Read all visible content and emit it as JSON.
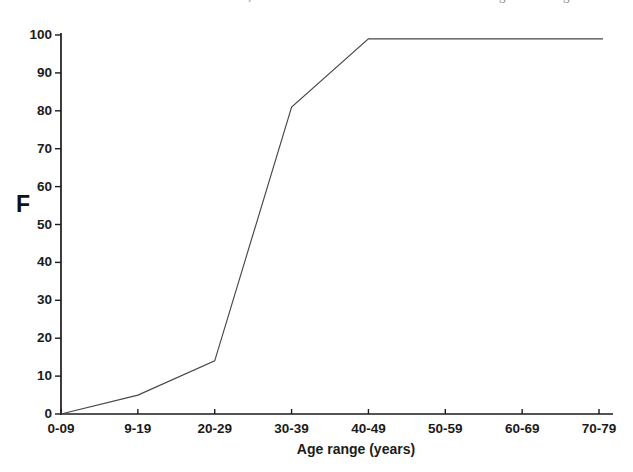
{
  "figure": {
    "background": "#ffffff",
    "text_color": "#1b1b1b",
    "axis_color": "#1b1b1b",
    "line_color": "#474747"
  },
  "cropped_text_fragments": [
    {
      "char": ",",
      "x": 248
    },
    {
      "char": "g",
      "x": 499
    },
    {
      "char": "g",
      "x": 563
    }
  ],
  "chart_data": {
    "type": "line",
    "title": "",
    "xlabel": "Age range (years)",
    "ylabel": "F",
    "categories": [
      "0-09",
      "9-19",
      "20-29",
      "30-39",
      "40-49",
      "50-59",
      "60-69",
      "70-79"
    ],
    "values": [
      0,
      5,
      14,
      81,
      99,
      99,
      99,
      99
    ],
    "yticks": [
      0,
      10,
      20,
      30,
      40,
      50,
      60,
      70,
      80,
      90,
      100
    ],
    "ylim": [
      0,
      100
    ],
    "grid": false,
    "legend": "none",
    "series_count": 1
  }
}
